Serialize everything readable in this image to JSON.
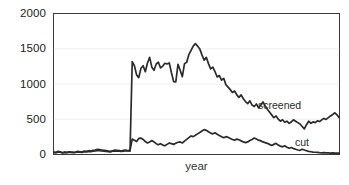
{
  "chart_data": {
    "type": "line",
    "title": "",
    "subtitle": "",
    "xlabel": "year",
    "ylabel": "",
    "ylim": [
      0,
      2000
    ],
    "yticks": [
      0,
      500,
      1000,
      1500,
      2000
    ],
    "ytick_labels": [
      "0",
      "500",
      "1000",
      "1500",
      "2000"
    ],
    "xticks": [],
    "xtick_labels": [],
    "grid": "horizontal",
    "grid_color": "#eeeeee",
    "legend_position": "inline-right",
    "series_color": "#2b2b2b",
    "series": [
      {
        "name": "screened",
        "label": "screened",
        "values": [
          30,
          25,
          40,
          35,
          20,
          30,
          25,
          35,
          30,
          25,
          30,
          40,
          35,
          30,
          45,
          40,
          50,
          45,
          55,
          60,
          70,
          65,
          60,
          55,
          50,
          45,
          40,
          50,
          60,
          55,
          50,
          45,
          55,
          60,
          50,
          45,
          1320,
          1260,
          1130,
          1090,
          1225,
          1260,
          1175,
          1300,
          1380,
          1240,
          1195,
          1285,
          1310,
          1230,
          1255,
          1295,
          1285,
          1300,
          1160,
          1035,
          1030,
          1280,
          1195,
          1105,
          1290,
          1310,
          1420,
          1480,
          1540,
          1575,
          1540,
          1500,
          1415,
          1340,
          1380,
          1290,
          1215,
          1240,
          1175,
          1100,
          1120,
          1055,
          1080,
          990,
          955,
          920,
          880,
          900,
          845,
          810,
          845,
          790,
          750,
          720,
          760,
          700,
          680,
          715,
          660,
          700,
          745,
          690,
          640,
          600,
          560,
          520,
          545,
          500,
          470,
          490,
          455,
          470,
          440,
          460,
          490,
          470,
          450,
          430,
          395,
          360,
          420,
          470,
          440,
          460,
          450,
          475,
          465,
          490,
          510,
          495,
          520,
          545,
          565,
          590,
          560,
          520
        ]
      },
      {
        "name": "cut",
        "label": "cut",
        "values": [
          25,
          20,
          30,
          28,
          18,
          25,
          22,
          30,
          26,
          22,
          25,
          32,
          30,
          26,
          35,
          32,
          40,
          36,
          42,
          46,
          52,
          50,
          46,
          42,
          40,
          36,
          34,
          42,
          48,
          44,
          42,
          38,
          44,
          50,
          46,
          60,
          215,
          200,
          180,
          225,
          230,
          210,
          180,
          160,
          175,
          195,
          175,
          150,
          135,
          150,
          130,
          120,
          140,
          160,
          150,
          140,
          155,
          170,
          175,
          160,
          185,
          210,
          235,
          260,
          250,
          270,
          290,
          310,
          330,
          350,
          340,
          320,
          300,
          290,
          305,
          285,
          265,
          250,
          235,
          250,
          240,
          225,
          210,
          200,
          215,
          205,
          190,
          175,
          165,
          175,
          195,
          210,
          230,
          215,
          200,
          190,
          175,
          165,
          155,
          140,
          125,
          140,
          155,
          130,
          115,
          105,
          120,
          100,
          85,
          95,
          80,
          70,
          60,
          55,
          70,
          60,
          50,
          40,
          35,
          30,
          28,
          25,
          22,
          20,
          22,
          20,
          18,
          16,
          18,
          16,
          15,
          14
        ]
      }
    ]
  }
}
